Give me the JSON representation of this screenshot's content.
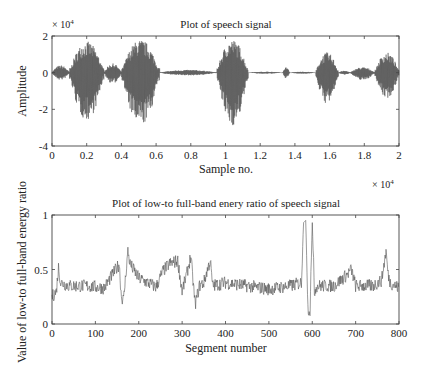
{
  "chart_data": [
    {
      "type": "line",
      "title": "Plot of speech signal",
      "xlabel": "Sample no.",
      "ylabel": "Amplitude",
      "x_multiplier": "× 10^4",
      "y_multiplier": "× 10^4",
      "xlim": [
        0,
        2
      ],
      "ylim": [
        -4,
        2
      ],
      "xticks": [
        "0",
        "0.2",
        "0.4",
        "0.6",
        "0.8",
        "1",
        "1.2",
        "1.4",
        "1.6",
        "1.8",
        "2"
      ],
      "yticks": [
        "2",
        "0",
        "-2",
        "-4"
      ],
      "grid": false,
      "series": [
        {
          "name": "speech signal",
          "segments_envelope": [
            {
              "x_start": 0.0,
              "x_end": 0.1,
              "max": 0.4,
              "min": -0.4
            },
            {
              "x_start": 0.1,
              "x_end": 0.3,
              "max": 1.7,
              "min": -2.6
            },
            {
              "x_start": 0.3,
              "x_end": 0.4,
              "max": 0.5,
              "min": -0.6
            },
            {
              "x_start": 0.4,
              "x_end": 0.62,
              "max": 1.8,
              "min": -2.9
            },
            {
              "x_start": 0.62,
              "x_end": 0.95,
              "max": 0.15,
              "min": -0.15
            },
            {
              "x_start": 0.95,
              "x_end": 1.13,
              "max": 1.8,
              "min": -2.9
            },
            {
              "x_start": 1.13,
              "x_end": 1.33,
              "max": 0.05,
              "min": -0.05
            },
            {
              "x_start": 1.33,
              "x_end": 1.37,
              "max": 0.3,
              "min": -0.3
            },
            {
              "x_start": 1.37,
              "x_end": 1.52,
              "max": 0.05,
              "min": -0.05
            },
            {
              "x_start": 1.52,
              "x_end": 1.65,
              "max": 1.1,
              "min": -1.7
            },
            {
              "x_start": 1.65,
              "x_end": 1.72,
              "max": 0.1,
              "min": -0.1
            },
            {
              "x_start": 1.72,
              "x_end": 1.86,
              "max": 0.3,
              "min": -0.4
            },
            {
              "x_start": 1.86,
              "x_end": 2.0,
              "max": 1.1,
              "min": -1.4
            }
          ]
        }
      ]
    },
    {
      "type": "line",
      "title": "Plot of low-to full-band enery ratio of speech signal",
      "xlabel": "Segment number",
      "ylabel": "Value of low-to full-band energy ratio",
      "xlim": [
        0,
        800
      ],
      "ylim": [
        0,
        1
      ],
      "xticks": [
        "0",
        "100",
        "200",
        "300",
        "400",
        "500",
        "600",
        "700",
        "800"
      ],
      "yticks": [
        "1",
        "0.5",
        "0"
      ],
      "grid": false,
      "series": [
        {
          "name": "energy ratio",
          "x": [
            0,
            10,
            15,
            20,
            40,
            80,
            120,
            155,
            160,
            165,
            170,
            175,
            180,
            200,
            240,
            255,
            270,
            290,
            300,
            310,
            320,
            330,
            340,
            350,
            360,
            365,
            370,
            400,
            450,
            500,
            550,
            575,
            580,
            585,
            590,
            595,
            600,
            605,
            610,
            650,
            680,
            690,
            700,
            740,
            760,
            770,
            775,
            780,
            800
          ],
          "values": [
            0.25,
            0.3,
            0.52,
            0.38,
            0.35,
            0.35,
            0.33,
            0.55,
            0.25,
            0.22,
            0.45,
            0.67,
            0.55,
            0.42,
            0.34,
            0.48,
            0.55,
            0.58,
            0.3,
            0.45,
            0.62,
            0.18,
            0.35,
            0.38,
            0.52,
            0.58,
            0.35,
            0.38,
            0.35,
            0.32,
            0.35,
            0.38,
            0.93,
            0.95,
            0.15,
            0.12,
            0.93,
            0.3,
            0.35,
            0.35,
            0.45,
            0.5,
            0.35,
            0.35,
            0.4,
            0.67,
            0.45,
            0.38,
            0.33
          ]
        }
      ]
    }
  ],
  "top_plot": {
    "title": "Plot of speech signal",
    "ylabel": "Amplitude",
    "xlabel": "Sample no.",
    "y_mult_base": "× 10",
    "y_mult_exp": "4",
    "x_mult_base": "× 10",
    "x_mult_exp": "4"
  },
  "bottom_plot": {
    "title": "Plot of low-to full-band enery ratio of speech signal",
    "ylabel": "Value of low-to full-band energy ratio",
    "xlabel": "Segment number"
  },
  "colors": {
    "line": "#555555",
    "axis": "#444444",
    "text": "#222222"
  }
}
